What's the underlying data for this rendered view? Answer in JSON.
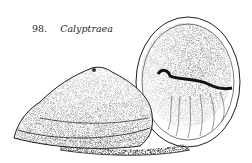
{
  "figure": {
    "number": "98.",
    "label": "Calyptraea",
    "ink_color": "#1e1e1e",
    "paper_color": "#ffffff"
  }
}
